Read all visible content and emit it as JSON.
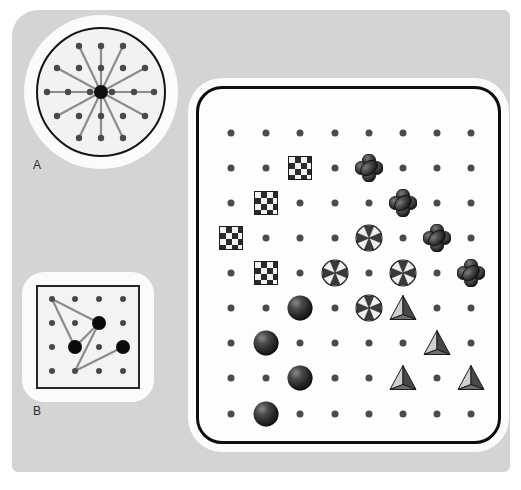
{
  "figure": {
    "background_color": "#d4d4d4",
    "card_color": "#fdfdfd"
  },
  "panels": [
    {
      "id": "A",
      "label": "A",
      "shape": "circle",
      "description": "Circle containing a dot lattice with a large central black dot joined by straight line segments to outer lattice dots",
      "center_dot": {
        "x": 65,
        "y": 65,
        "r": 7,
        "color": "#101010"
      },
      "dot_color": "#4a4a4a",
      "dot_radius": 3.2,
      "line_color": "#8c8c8c",
      "dots": [
        [
          43,
          19
        ],
        [
          65,
          19
        ],
        [
          87,
          19
        ],
        [
          21,
          41
        ],
        [
          43,
          41
        ],
        [
          65,
          41
        ],
        [
          87,
          41
        ],
        [
          109,
          41
        ],
        [
          11,
          65
        ],
        [
          32,
          65
        ],
        [
          54,
          65
        ],
        [
          76,
          65
        ],
        [
          98,
          65
        ],
        [
          118,
          65
        ],
        [
          21,
          89
        ],
        [
          43,
          89
        ],
        [
          65,
          89
        ],
        [
          87,
          89
        ],
        [
          109,
          89
        ],
        [
          43,
          111
        ],
        [
          65,
          111
        ],
        [
          87,
          111
        ]
      ],
      "spokes": [
        [
          43,
          19
        ],
        [
          87,
          19
        ],
        [
          21,
          41
        ],
        [
          109,
          41
        ],
        [
          11,
          65
        ],
        [
          118,
          65
        ],
        [
          21,
          89
        ],
        [
          109,
          89
        ],
        [
          43,
          111
        ],
        [
          87,
          111
        ],
        [
          65,
          19
        ],
        [
          65,
          111
        ]
      ]
    },
    {
      "id": "B",
      "label": "B",
      "shape": "square",
      "description": "Square containing a 4 by 4 dot lattice with three enlarged black dots connected by a polyline",
      "dot_color": "#4a4a4a",
      "dot_radius": 3,
      "big_dot_color": "#0b0b0b",
      "big_dot_radius": 7,
      "line_color": "#8c8c8c",
      "dots": [
        [
          16,
          14
        ],
        [
          39,
          14
        ],
        [
          63,
          14
        ],
        [
          87,
          14
        ],
        [
          16,
          38
        ],
        [
          39,
          38
        ],
        [
          63,
          38
        ],
        [
          87,
          38
        ],
        [
          16,
          62
        ],
        [
          39,
          62
        ],
        [
          63,
          62
        ],
        [
          87,
          62
        ],
        [
          16,
          86
        ],
        [
          39,
          86
        ],
        [
          63,
          86
        ],
        [
          87,
          86
        ]
      ],
      "big_dots": [
        [
          63,
          38
        ],
        [
          39,
          62
        ],
        [
          87,
          62
        ]
      ],
      "polyline": [
        [
          16,
          14
        ],
        [
          63,
          38
        ],
        [
          39,
          62
        ],
        [
          16,
          14
        ]
      ],
      "polyline2": [
        [
          63,
          38
        ],
        [
          39,
          86
        ],
        [
          87,
          62
        ]
      ]
    },
    {
      "id": "C",
      "label": "",
      "shape": "rounded-rectangle",
      "description": "Large rounded card holding a 9 row by 8 column lattice where selected sites are marked with one of five distinct glyph types"
    }
  ],
  "legend_glyphs": [
    {
      "key": "dot",
      "name": "plain-lattice-dot",
      "description": "small gray dot marking an unoccupied lattice site"
    },
    {
      "key": "checker",
      "name": "checkerboard-square",
      "description": "square with a black and white checkerboard fill"
    },
    {
      "key": "clover",
      "name": "four-lobe-clover",
      "description": "dark four-lobed rounded cross"
    },
    {
      "key": "pinwheel",
      "name": "octagon-pinwheel",
      "description": "octagon split into alternating dark and light wedges"
    },
    {
      "key": "sphere",
      "name": "shaded-sphere",
      "description": "dark shaded 3-D ball with highlight"
    },
    {
      "key": "pyramid",
      "name": "shaded-pyramid",
      "description": "3-D triangular pyramid with light and dark faces"
    }
  ],
  "grid": {
    "rows": 9,
    "cols": 8,
    "col_x": [
      32,
      67,
      101,
      136,
      170,
      204,
      238,
      272
    ],
    "row_y": [
      44,
      79,
      114,
      149,
      184,
      219,
      254,
      289,
      325
    ],
    "cells": [
      [
        "dot",
        "dot",
        "dot",
        "dot",
        "dot",
        "dot",
        "dot",
        "dot"
      ],
      [
        "dot",
        "dot",
        "checker",
        "dot",
        "clover",
        "dot",
        "dot",
        "dot"
      ],
      [
        "dot",
        "checker",
        "dot",
        "dot",
        "dot",
        "clover",
        "dot",
        "dot"
      ],
      [
        "checker",
        "dot",
        "dot",
        "dot",
        "pinwheel",
        "dot",
        "clover",
        "dot"
      ],
      [
        "dot",
        "checker",
        "dot",
        "pinwheel",
        "dot",
        "pinwheel",
        "dot",
        "clover"
      ],
      [
        "dot",
        "dot",
        "sphere",
        "dot",
        "pinwheel",
        "pyramid",
        "dot",
        "dot"
      ],
      [
        "dot",
        "sphere",
        "dot",
        "dot",
        "dot",
        "dot",
        "pyramid",
        "dot"
      ],
      [
        "dot",
        "dot",
        "sphere",
        "dot",
        "dot",
        "pyramid",
        "dot",
        "pyramid"
      ],
      [
        "dot",
        "sphere",
        "dot",
        "dot",
        "dot",
        "dot",
        "dot",
        "dot"
      ]
    ]
  }
}
